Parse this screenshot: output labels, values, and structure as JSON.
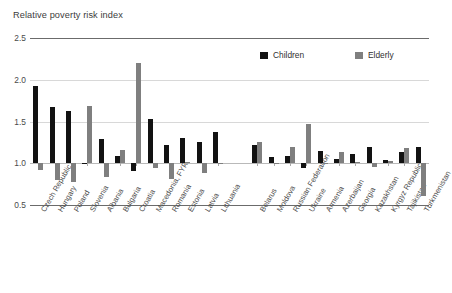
{
  "chart_data": {
    "type": "bar",
    "title": "Relative poverty risk index",
    "xlabel": "",
    "ylabel": "",
    "ylim": [
      0.5,
      2.5
    ],
    "yticks": [
      0.5,
      1.0,
      1.5,
      2.0,
      2.5
    ],
    "ytick_labels": [
      "0.5",
      "1.0",
      "1.5",
      "2.0",
      "2.5"
    ],
    "baseline": 1.0,
    "grid": true,
    "legend_position": "top-right",
    "colors": {
      "children": "#121212",
      "elderly": "#7f7f7f"
    },
    "categories": [
      "Czech Republic",
      "Hungary",
      "Poland",
      "Slovenia",
      "Albania",
      "Bulgaria",
      "Croatia",
      "Macedonia, FYR",
      "Romania",
      "Estonia",
      "Latvia",
      "Lithuania",
      "Belarus",
      "Moldova",
      "Russian Federation",
      "Ukraine",
      "Armenia",
      "Azerbaijan",
      "Georgia",
      "Kazakhstan",
      "Kyrgyz Republic",
      "Tajikistan",
      "Turkmenistan"
    ],
    "groups": [
      {
        "name": "Central and South-Eastern Europe",
        "start": 0,
        "count": 12
      },
      {
        "name": "Commonwealth of Independent States",
        "start": 12,
        "count": 11
      }
    ],
    "series": [
      {
        "name": "Children",
        "color": "#121212",
        "values": [
          1.93,
          1.67,
          1.62,
          0.99,
          1.29,
          1.09,
          0.91,
          1.53,
          1.22,
          1.3,
          1.25,
          1.38,
          1.22,
          1.07,
          1.09,
          0.94,
          1.15,
          1.05,
          1.11,
          1.19,
          1.04,
          1.14,
          1.2
        ]
      },
      {
        "name": "Elderly",
        "color": "#7f7f7f",
        "values": [
          0.92,
          0.8,
          0.77,
          1.68,
          0.83,
          1.16,
          2.2,
          0.94,
          0.81,
          1.01,
          0.88,
          1.0,
          1.26,
          1.0,
          1.19,
          1.47,
          1.0,
          1.14,
          1.01,
          0.95,
          1.03,
          1.18,
          0.61
        ]
      }
    ]
  },
  "legend": {
    "items": [
      {
        "label": "Children",
        "color": "#121212"
      },
      {
        "label": "Elderly",
        "color": "#7f7f7f"
      }
    ]
  }
}
